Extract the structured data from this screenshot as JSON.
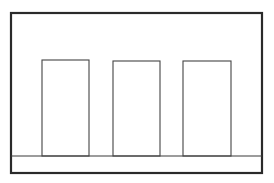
{
  "diagram": {
    "background": "#ffffff",
    "stroke_color": "#2a2a2a",
    "frame": {
      "x": 11,
      "y": 13,
      "width": 251,
      "height": 160,
      "stroke_width": 2.2
    },
    "baseline": {
      "y": 156,
      "x1": 11,
      "x2": 262,
      "stroke_width": 1.2
    },
    "rectangles": [
      {
        "label": "",
        "x": 42,
        "y": 60,
        "width": 47,
        "height": 96
      },
      {
        "label": "",
        "x": 113,
        "y": 61,
        "width": 47,
        "height": 95
      },
      {
        "label": "",
        "x": 183,
        "y": 61,
        "width": 48,
        "height": 95
      }
    ]
  }
}
